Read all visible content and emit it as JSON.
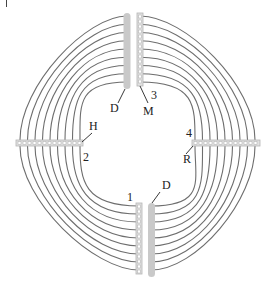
{
  "figure": {
    "type": "diagram",
    "stroke_color": "#6b6b6b",
    "rod_color": "#c8c8c8",
    "ladder_color": "#bdbdbd",
    "arc_count_per_quadrant": 9
  },
  "labels": {
    "top_rod": "D",
    "top_ladder": "M",
    "top_number": "3",
    "left_ladder": "H",
    "left_number": "2",
    "right_number": "4",
    "right_ladder": "R",
    "bottom_number": "1",
    "bottom_rod": "D"
  }
}
